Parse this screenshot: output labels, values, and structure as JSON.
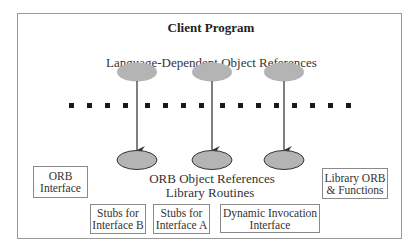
{
  "diagram": {
    "title": "Client Program",
    "top_layer_label": "Language-Dependent Object References",
    "bottom_layer_label": "ORB Object References",
    "library_label": "Library Routines",
    "boxes": {
      "orb_interface": "ORB\nInterface",
      "library_orb": "Library ORB\n& Functions",
      "stubs_b": "Stubs for\nInterface B",
      "stubs_a": "Stubs for\nInterface A",
      "dii": "Dynamic Invocation\nInterface"
    },
    "language_dependent_refs_count": 3,
    "orb_refs_count": 3,
    "boundary_dots_count": 16,
    "colors": {
      "ellipse_fill": "#b4b4b4",
      "dot": "#1a1a1a",
      "frame": "#9a9a9a",
      "arrow": "#2a2a2a"
    }
  }
}
